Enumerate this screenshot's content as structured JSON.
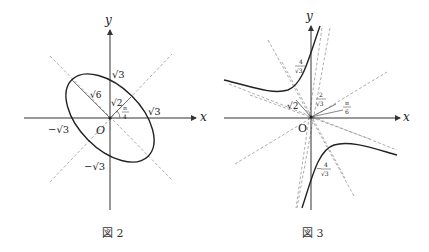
{
  "figures": [
    {
      "id": "fig2",
      "caption": "図 2",
      "axis_x": "x",
      "axis_y": "y",
      "origin": "O",
      "labels": {
        "sqrt3_y": "√3",
        "sqrt3_x": "√3",
        "neg_sqrt3_x": "−√3",
        "neg_sqrt3_y": "−√3",
        "sqrt6": "√6",
        "sqrt2": "√2",
        "angle_num": "π",
        "angle_den": "4"
      },
      "curve": "ellipse rotated π/4, semi-axes √6 (along y=−x) and √2 (along y=x)"
    },
    {
      "id": "fig3",
      "caption": "図 3",
      "axis_x": "x",
      "axis_y": "y",
      "origin": "O",
      "labels": {
        "four_num_top": "4",
        "four_den_top": "√3",
        "sqrt2": "√2",
        "two_num": "2",
        "two_den": "√3",
        "angle_num": "π",
        "angle_den": "6",
        "four_num_bot": "4",
        "four_den_bot": "√3",
        "neg_sign": "−"
      },
      "curve": "hyperbola rotated π/6"
    }
  ],
  "colors": {
    "curve": "#222222",
    "axis": "#333333",
    "dashed": "#999999"
  }
}
